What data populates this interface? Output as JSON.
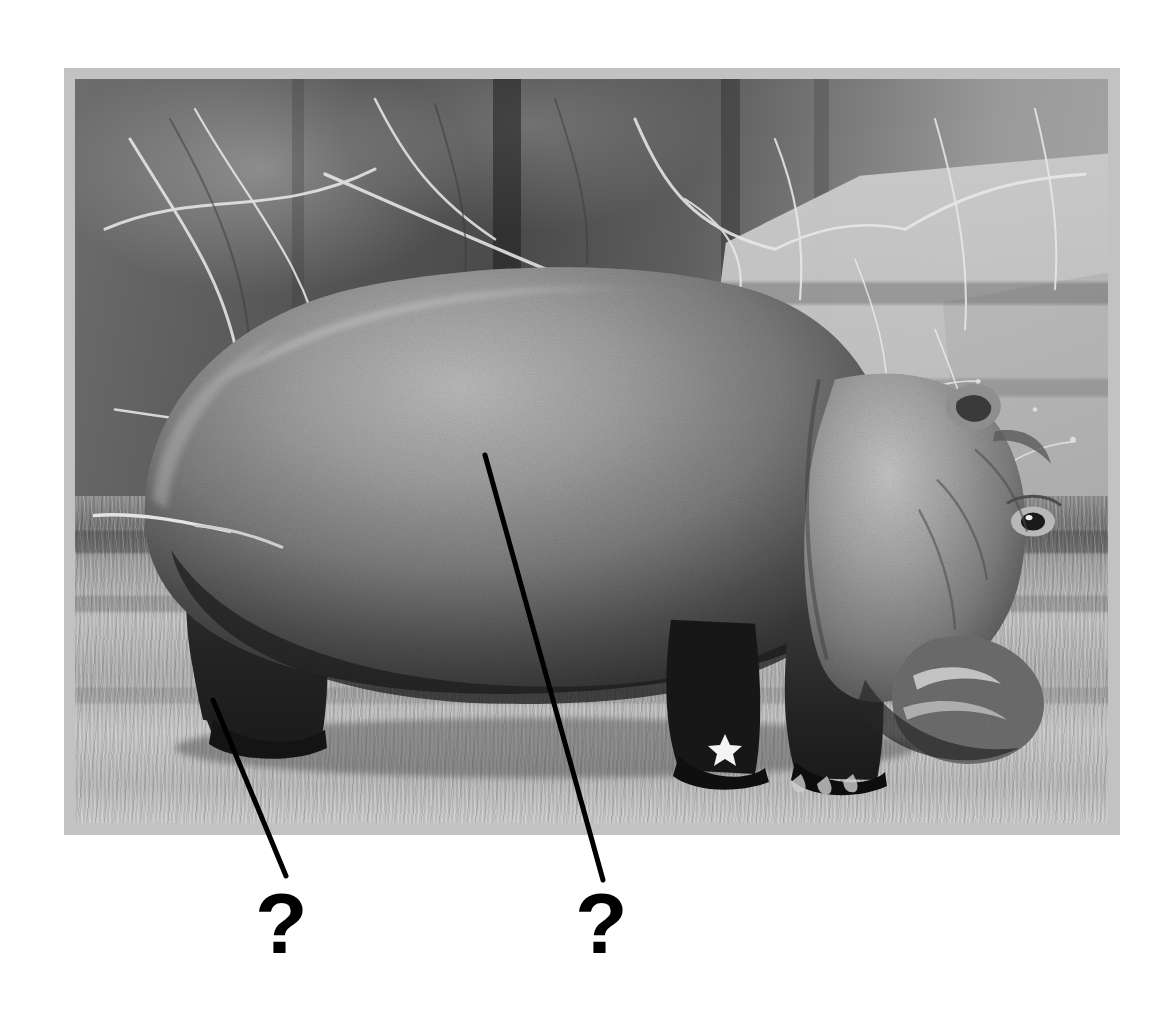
{
  "worksheet": {
    "type": "anatomy-labeling-exercise",
    "background_color": "#ffffff",
    "labels": [
      {
        "id": "label-1",
        "text": "?",
        "x": 255,
        "y": 880,
        "points_to": "hind-leg"
      },
      {
        "id": "label-2",
        "text": "?",
        "x": 575,
        "y": 880,
        "points_to": "body-torso"
      }
    ]
  },
  "photo_frame": {
    "border_color": "#c2c2c2",
    "border_width_px": 11,
    "x": 64,
    "y": 68,
    "width": 1056,
    "height": 767
  },
  "photograph": {
    "subject": "hippopotamus",
    "color_mode": "black-and-white",
    "scene": "zoo enclosure with bare winter trees, pale rock slabs and dry grass",
    "subject_pose": "standing in profile facing right, head lowered toward the ground",
    "elements": [
      {
        "name": "hippo-body",
        "description": "large rounded dark gray torso"
      },
      {
        "name": "hippo-head",
        "description": "lowered head with visible ear, eye and broad muzzle"
      },
      {
        "name": "hippo-foreleg-front",
        "description": "front leg with toes on grass"
      },
      {
        "name": "hippo-foreleg-rear",
        "description": "second front leg in shadow"
      },
      {
        "name": "hippo-hindleg",
        "description": "dark hind leg at the left"
      },
      {
        "name": "background-branches",
        "description": "bare pale branches crossing the upper frame"
      },
      {
        "name": "background-rocks",
        "description": "light gray stacked rock slabs at right"
      },
      {
        "name": "ground-grass",
        "description": "dry banded grass across the lower frame"
      }
    ]
  },
  "leader_lines": [
    {
      "id": "leader-line-1",
      "x1": 213,
      "y1": 700,
      "x2": 286,
      "y2": 876,
      "color": "#000000",
      "width": 5
    },
    {
      "id": "leader-line-2",
      "x1": 485,
      "y1": 455,
      "x2": 603,
      "y2": 880,
      "color": "#000000",
      "width": 5
    }
  ],
  "colors": {
    "page_background": "#ffffff",
    "frame_mat": "#c2c2c2",
    "annotation": "#000000"
  }
}
